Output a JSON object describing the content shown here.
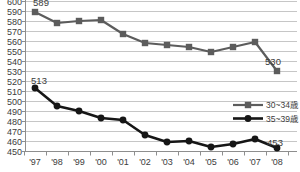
{
  "chart_data": {
    "type": "line",
    "title": "",
    "xlabel": "",
    "ylabel": "",
    "x": [
      "'97",
      "'98",
      "'99",
      "'00",
      "'01",
      "'02",
      "'03",
      "'04",
      "'05",
      "'06",
      "'07",
      "'08"
    ],
    "series": [
      {
        "name": "30~34歳",
        "values": [
          589,
          578,
          580,
          581,
          567,
          558,
          556,
          554,
          549,
          554,
          559,
          530
        ],
        "color": "#5c5c5c",
        "marker": "square"
      },
      {
        "name": "35~39歳",
        "values": [
          513,
          495,
          490,
          483,
          481,
          466,
          459,
          460,
          454,
          457,
          462,
          453
        ],
        "color": "#161616",
        "marker": "circle"
      }
    ],
    "ylim": [
      450,
      600
    ],
    "ytick_step": 10,
    "y_tick_labels": [
      "450",
      "460",
      "470",
      "480",
      "490",
      "500",
      "510",
      "520",
      "530",
      "540",
      "550",
      "560",
      "570",
      "580",
      "590",
      "600"
    ],
    "grid": true,
    "legend_position": "middle-right",
    "point_labels": [
      {
        "series": 0,
        "index": 0,
        "text": "589",
        "dx": 6,
        "dy": -6
      },
      {
        "series": 0,
        "index": 11,
        "text": "530",
        "dx": -4,
        "dy": -6
      },
      {
        "series": 1,
        "index": 0,
        "text": "513",
        "dx": 4,
        "dy": -4
      },
      {
        "series": 1,
        "index": 11,
        "text": "453",
        "dx": -2,
        "dy": -2
      }
    ],
    "colors": {
      "gridline": "#c6c6c6",
      "axis": "#8e8e8e",
      "tick_text": "#3c3c3c",
      "label_text": "#3c3c3c"
    }
  },
  "legend": {
    "items": [
      {
        "label": "30~34歳"
      },
      {
        "label": "35~39歳"
      }
    ]
  }
}
